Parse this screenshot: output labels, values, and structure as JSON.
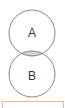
{
  "diagram": {
    "type": "venn",
    "sets": [
      {
        "label": "A",
        "cx": 32,
        "cy": 33,
        "r": 23
      },
      {
        "label": "B",
        "cx": 32,
        "cy": 74,
        "r": 23
      }
    ],
    "shaded_region": "A ∩ B",
    "colors": {
      "outline": "#777777",
      "shade": "#d9cfe6",
      "answer_border": "#f0b890"
    }
  }
}
